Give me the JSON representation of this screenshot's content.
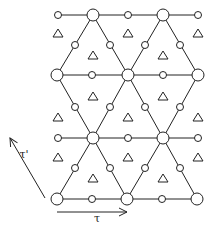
{
  "diagram": {
    "colors": {
      "stroke": "#222222",
      "background": "#ffffff"
    },
    "large_nodes": [
      [
        93,
        15
      ],
      [
        163,
        15
      ],
      [
        57,
        75
      ],
      [
        128,
        75
      ],
      [
        198,
        75
      ],
      [
        93,
        138
      ],
      [
        163,
        138
      ],
      [
        57,
        199
      ],
      [
        127,
        199
      ],
      [
        197,
        199
      ]
    ],
    "small_nodes": [
      [
        58,
        15
      ],
      [
        128,
        15
      ],
      [
        198,
        15
      ],
      [
        75,
        45
      ],
      [
        110,
        45
      ],
      [
        145,
        45
      ],
      [
        180,
        45
      ],
      [
        92,
        75
      ],
      [
        163,
        75
      ],
      [
        75,
        107
      ],
      [
        110,
        107
      ],
      [
        145,
        107
      ],
      [
        180,
        107
      ],
      [
        58,
        138
      ],
      [
        128,
        138
      ],
      [
        198,
        138
      ],
      [
        75,
        168
      ],
      [
        110,
        168
      ],
      [
        145,
        168
      ],
      [
        180,
        168
      ],
      [
        92,
        199
      ],
      [
        162,
        199
      ]
    ],
    "triangles": [
      [
        58,
        33
      ],
      [
        128,
        33
      ],
      [
        198,
        33
      ],
      [
        93,
        55
      ],
      [
        163,
        55
      ],
      [
        93,
        96
      ],
      [
        163,
        96
      ],
      [
        58,
        117
      ],
      [
        128,
        117
      ],
      [
        198,
        117
      ],
      [
        58,
        157
      ],
      [
        128,
        157
      ],
      [
        198,
        157
      ],
      [
        93,
        178
      ],
      [
        163,
        178
      ]
    ],
    "vectors": {
      "tau": {
        "label": "τ",
        "from": [
          57,
          212
        ],
        "to": [
          127,
          212
        ],
        "label_pos": [
          97,
          222
        ]
      },
      "tau_prime": {
        "label": "τ'",
        "from": [
          45,
          198
        ],
        "to": [
          10,
          138
        ],
        "label_pos": [
          24,
          158
        ]
      }
    }
  }
}
